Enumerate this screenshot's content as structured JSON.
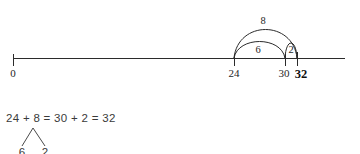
{
  "figure": {
    "background_color": "#ffffff",
    "ink_color": "#2b2b2b"
  },
  "number_line": {
    "start_label": "0",
    "ticks": [
      {
        "label": "0",
        "value": 0,
        "x": 13,
        "bold": false
      },
      {
        "label": "24",
        "value": 24,
        "x": 234,
        "bold": false
      },
      {
        "label": "30",
        "value": 30,
        "x": 285,
        "bold": false
      },
      {
        "label": "32",
        "value": 32,
        "x": 297,
        "bold": true
      }
    ],
    "line_y": 58,
    "line_x_start": 13,
    "line_x_end": 345
  },
  "arcs": [
    {
      "name": "outer-jump-8",
      "label": "8",
      "from_value": 24,
      "to_value": 32,
      "from_x": 234,
      "to_x": 297,
      "apex_y": 27,
      "label_x": 263,
      "label_y": 24
    },
    {
      "name": "inner-jump-6",
      "label": "6",
      "from_value": 24,
      "to_value": 30,
      "from_x": 234,
      "to_x": 285,
      "apex_y": 42,
      "label_x": 258,
      "label_y": 53
    },
    {
      "name": "inner-jump-2",
      "label": "2",
      "from_value": 30,
      "to_value": 32,
      "from_x": 285,
      "to_x": 297,
      "apex_y": 40,
      "label_x": 291,
      "label_y": 53
    }
  ],
  "equation": {
    "text": "24 + 8 = 30 + 2 = 32",
    "x": 6,
    "y": 122
  },
  "decomposition_tree": {
    "apex_x": 33,
    "apex_y": 127,
    "left": {
      "label": "6",
      "x": 22,
      "y": 152
    },
    "right": {
      "label": "2",
      "x": 45,
      "y": 152
    }
  }
}
